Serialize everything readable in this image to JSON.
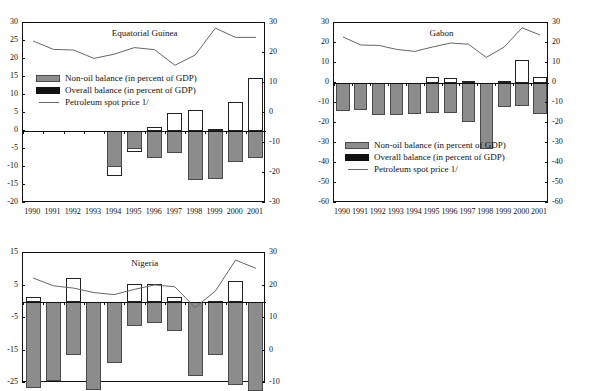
{
  "figure": {
    "background": "#ffffff",
    "bar_fill": "#8c8c8c",
    "bar_outline_color": "#222222",
    "line_color": "#666666"
  },
  "legend": {
    "non_oil": "Non-oil balance (in percent of GDP)",
    "overall": "Overall balance (in percent of GDP)",
    "spot_price": "Petroleum spot price 1/"
  },
  "years": [
    "1990",
    "1991",
    "1992",
    "1993",
    "1994",
    "1995",
    "1996",
    "1997",
    "1998",
    "1999",
    "2000",
    "2001"
  ],
  "chart_data": [
    {
      "type": "bar",
      "title": "Equatorial Guinea",
      "xlabel": "",
      "ylabel": "",
      "categories": [
        "1990",
        "1991",
        "1992",
        "1993",
        "1994",
        "1995",
        "1996",
        "1997",
        "1998",
        "1999",
        "2000",
        "2001"
      ],
      "ylim": [
        -20,
        30
      ],
      "yticks": [
        30,
        25,
        20,
        15,
        10,
        5,
        0,
        -5,
        -10,
        -15,
        -20
      ],
      "y2lim": [
        -30,
        30
      ],
      "y2ticks": [
        30,
        20,
        10,
        0,
        -10,
        -20,
        -30
      ],
      "grid": false,
      "legend_position": "upper left",
      "series": [
        {
          "name": "Overall balance (in percent of GDP)",
          "kind": "bar-outline",
          "axis": "left",
          "values": [
            0.0,
            0.0,
            0.0,
            0.0,
            -12.6,
            -5.8,
            1.1,
            4.9,
            5.9,
            0.5,
            8.1,
            14.6
          ]
        },
        {
          "name": "Non-oil balance (in percent of GDP)",
          "kind": "bar-filled",
          "axis": "left",
          "values": [
            0.0,
            0.0,
            0.0,
            0.0,
            -10.0,
            -5.1,
            -7.5,
            -6.0,
            -13.7,
            -13.4,
            -8.5,
            -7.4
          ]
        },
        {
          "name": "Petroleum spot price 1/",
          "kind": "line",
          "axis": "right",
          "values": [
            24.0,
            21.2,
            21.0,
            18.2,
            19.6,
            21.8,
            21.1,
            15.9,
            19.3,
            28.3,
            25.2,
            25.2
          ]
        }
      ]
    },
    {
      "type": "bar",
      "title": "Gabon",
      "xlabel": "",
      "ylabel": "",
      "categories": [
        "1990",
        "1991",
        "1992",
        "1993",
        "1994",
        "1995",
        "1996",
        "1997",
        "1998",
        "1999",
        "2000",
        "2001"
      ],
      "ylim": [
        -60,
        30
      ],
      "yticks": [
        30,
        20,
        10,
        0,
        -10,
        -20,
        -30,
        -40,
        -50,
        -60
      ],
      "y2lim": [
        -60,
        30
      ],
      "y2ticks": [
        30,
        20,
        10,
        0,
        -10,
        -20,
        -30,
        -40,
        -50,
        -60
      ],
      "grid": false,
      "legend_position": "lower left",
      "series": [
        {
          "name": "Overall balance (in percent of GDP)",
          "kind": "bar-outline",
          "axis": "left",
          "values": [
            -4.6,
            -2.2,
            -5.5,
            -5.8,
            -1.8,
            2.8,
            2.5,
            1.2,
            -13.9,
            1.0,
            11.7,
            3.0
          ]
        },
        {
          "name": "Non-oil balance (in percent of GDP)",
          "kind": "bar-filled",
          "axis": "left",
          "values": [
            -14.2,
            -13.6,
            -16.2,
            -16.1,
            -15.3,
            -15.2,
            -15.1,
            -19.7,
            -32.9,
            -12.0,
            -11.6,
            -15.3
          ]
        },
        {
          "name": "Petroleum spot price 1/",
          "kind": "line",
          "axis": "right",
          "values": [
            23.0,
            19.0,
            18.8,
            16.8,
            15.8,
            18.0,
            20.0,
            19.4,
            12.8,
            18.0,
            27.6,
            24.0
          ]
        }
      ]
    },
    {
      "type": "bar",
      "title": "Nigeria",
      "xlabel": "",
      "ylabel": "",
      "categories": [
        "1990",
        "1991",
        "1992",
        "1993",
        "1994",
        "1995",
        "1996",
        "1997",
        "1998",
        "1999",
        "2000",
        "2001"
      ],
      "ylim": [
        -25,
        15
      ],
      "yticks": [
        15,
        5,
        -5,
        -15,
        -25
      ],
      "y2lim": [
        -10,
        30
      ],
      "y2ticks": [
        30,
        20,
        10,
        0,
        -10
      ],
      "grid": false,
      "legend_position": "none",
      "series": [
        {
          "name": "Overall balance (in percent of GDP)",
          "kind": "bar-outline",
          "axis": "left",
          "values": [
            1.5,
            -0.3,
            7.2,
            -6.8,
            -3.7,
            5.5,
            5.4,
            1.5,
            -7.5,
            0.2,
            6.5,
            -3.0
          ]
        },
        {
          "name": "Non-oil balance (in percent of GDP)",
          "kind": "bar-filled",
          "axis": "left",
          "values": [
            -26.5,
            -24.5,
            -16.5,
            -27.0,
            -18.8,
            -7.5,
            -6.5,
            -9.0,
            -22.8,
            -16.5,
            -25.5,
            -27.5
          ]
        },
        {
          "name": "Petroleum spot price 1/",
          "kind": "line",
          "axis": "right",
          "values": [
            22.3,
            19.9,
            19.2,
            17.8,
            17.2,
            18.8,
            20.2,
            19.6,
            13.2,
            18.3,
            27.8,
            25.3
          ]
        }
      ]
    }
  ]
}
